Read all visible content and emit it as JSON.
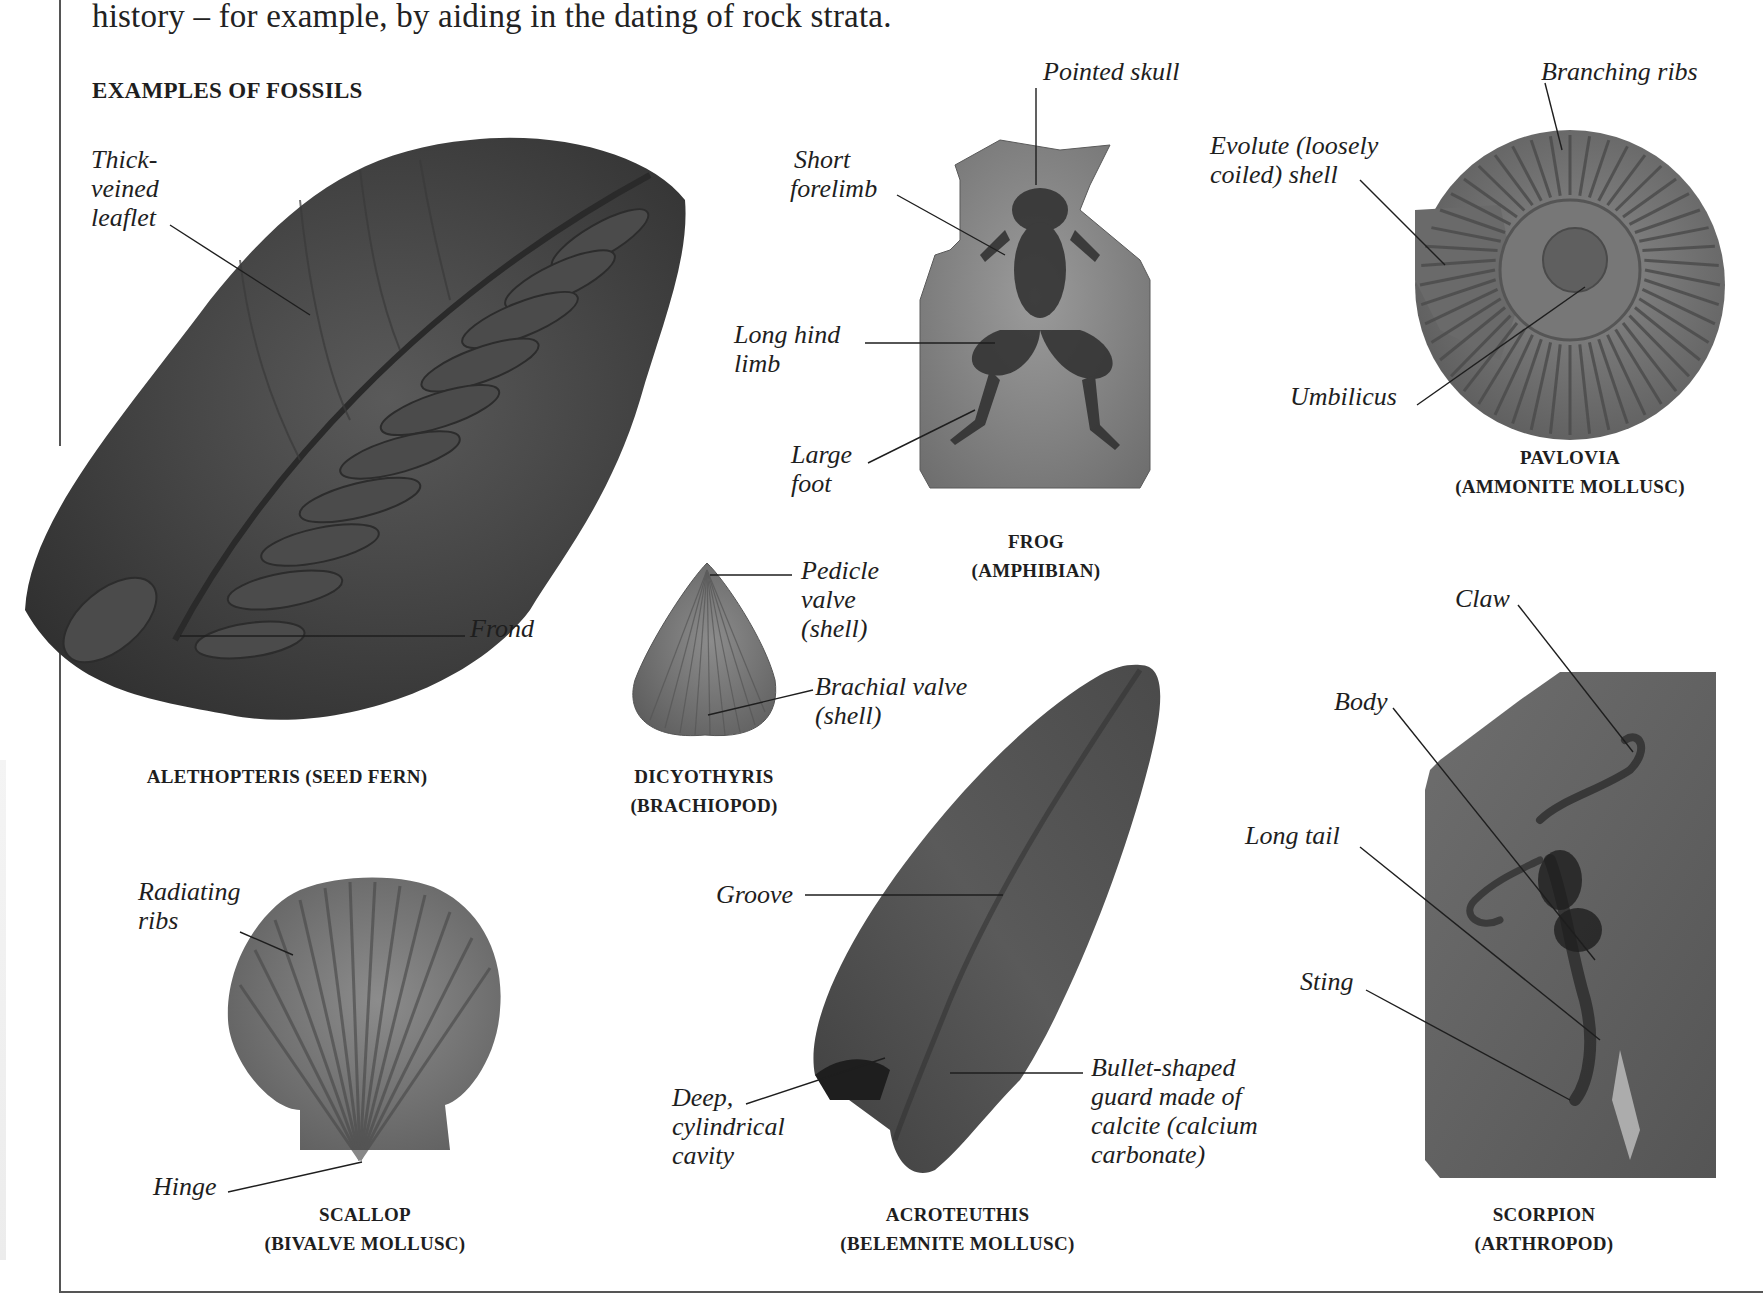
{
  "intro_text": "history – for example, by aiding in the dating of rock strata.",
  "section_title": "EXAMPLES OF FOSSILS",
  "fossils": {
    "fern": {
      "caption": "ALETHOPTERIS (SEED FERN)",
      "labels": {
        "leaflet_1": "Thick-",
        "leaflet_2": "veined",
        "leaflet_3": "leaflet",
        "frond": "Frond"
      }
    },
    "frog": {
      "caption_1": "FROG",
      "caption_2": "(AMPHIBIAN)",
      "labels": {
        "skull": "Pointed skull",
        "forelimb_1": "Short",
        "forelimb_2": "forelimb",
        "hindlimb_1": "Long hind",
        "hindlimb_2": "limb",
        "foot_1": "Large",
        "foot_2": "foot"
      }
    },
    "ammonite": {
      "caption_1": "PAVLOVIA",
      "caption_2": "(AMMONITE MOLLUSC)",
      "labels": {
        "ribs": "Branching ribs",
        "evolute_1": "Evolute (loosely",
        "evolute_2": "coiled) shell",
        "umbilicus": "Umbilicus"
      }
    },
    "brachiopod": {
      "caption_1": "DICYOTHYRIS",
      "caption_2": "(BRACHIOPOD)",
      "labels": {
        "pedicle_1": "Pedicle",
        "pedicle_2": "valve",
        "pedicle_3": "(shell)",
        "brachial_1": "Brachial valve",
        "brachial_2": "(shell)"
      }
    },
    "scorpion": {
      "caption_1": "SCORPION",
      "caption_2": "(ARTHROPOD)",
      "labels": {
        "claw": "Claw",
        "body": "Body",
        "tail": "Long tail",
        "sting": "Sting"
      }
    },
    "scallop": {
      "caption_1": "SCALLOP",
      "caption_2": "(BIVALVE MOLLUSC)",
      "labels": {
        "ribs_1": "Radiating",
        "ribs_2": "ribs",
        "hinge": "Hinge"
      }
    },
    "belemnite": {
      "caption_1": "ACROTEUTHIS",
      "caption_2": "(BELEMNITE MOLLUSC)",
      "labels": {
        "groove": "Groove",
        "cavity_1": "Deep,",
        "cavity_2": "cylindrical",
        "cavity_3": "cavity",
        "guard_1": "Bullet-shaped",
        "guard_2": "guard made of",
        "guard_3": "calcite (calcium",
        "guard_4": "carbonate)"
      }
    }
  }
}
